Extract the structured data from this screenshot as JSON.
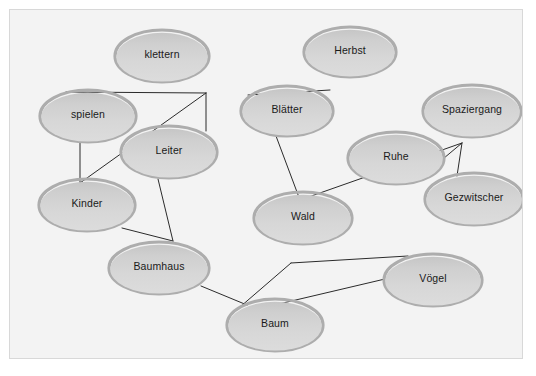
{
  "diagram": {
    "canvas": {
      "background_color": "#f3f3f3",
      "border_color": "#d8d8d8",
      "width": 514,
      "height": 350
    },
    "node_style": {
      "fill_top_color": "#c9c9c9",
      "fill_bottom_color": "#d9d9d9",
      "rim_color": "#adadad",
      "text_color": "#1a1a1a"
    },
    "edge_style": {
      "color": "#2b2b2b",
      "width": 1
    },
    "nodes": [
      {
        "id": "klettern",
        "label": "klettern",
        "cx": 152,
        "cy": 46,
        "rx": 48,
        "ry": 27
      },
      {
        "id": "herbst",
        "label": "Herbst",
        "cx": 340,
        "cy": 42,
        "rx": 47,
        "ry": 26
      },
      {
        "id": "spielen",
        "label": "spielen",
        "cx": 78,
        "cy": 106,
        "rx": 49,
        "ry": 27
      },
      {
        "id": "blaetter",
        "label": "Blätter",
        "cx": 277,
        "cy": 101,
        "rx": 47,
        "ry": 26
      },
      {
        "id": "spaziergang",
        "label": "Spaziergang",
        "cx": 462,
        "cy": 101,
        "rx": 50,
        "ry": 27
      },
      {
        "id": "leiter",
        "label": "Leiter",
        "cx": 159,
        "cy": 142,
        "rx": 49,
        "ry": 27
      },
      {
        "id": "ruhe",
        "label": "Ruhe",
        "cx": 386,
        "cy": 148,
        "rx": 49,
        "ry": 27
      },
      {
        "id": "kinder",
        "label": "Kinder",
        "cx": 77,
        "cy": 195,
        "rx": 49,
        "ry": 27
      },
      {
        "id": "gezwitscher",
        "label": "Gezwitscher",
        "cx": 464,
        "cy": 189,
        "rx": 50,
        "ry": 27
      },
      {
        "id": "wald",
        "label": "Wald",
        "cx": 293,
        "cy": 208,
        "rx": 50,
        "ry": 27
      },
      {
        "id": "baumhaus",
        "label": "Baumhaus",
        "cx": 149,
        "cy": 258,
        "rx": 51,
        "ry": 27
      },
      {
        "id": "voegel",
        "label": "Vögel",
        "cx": 423,
        "cy": 270,
        "rx": 50,
        "ry": 27
      },
      {
        "id": "baum",
        "label": "Baum",
        "cx": 265,
        "cy": 315,
        "rx": 49,
        "ry": 27
      }
    ],
    "edges": [
      {
        "id": "spielen-junction",
        "from": "spielen",
        "to": "junction-left",
        "points": "56,82 196,83"
      },
      {
        "id": "junction-leiter",
        "from": "junction-left",
        "to": "leiter",
        "points": "196,83 196,121"
      },
      {
        "id": "junction-kinder",
        "from": "junction-left",
        "to": "kinder",
        "points": "196,83 70,173"
      },
      {
        "id": "spielen-kinder",
        "from": "spielen",
        "to": "kinder",
        "points": "70,131 70,173"
      },
      {
        "id": "blaetter-herbst",
        "from": "blaetter",
        "to": "herbst",
        "points": "238,85 320,80"
      },
      {
        "id": "blaetter-wald",
        "from": "blaetter",
        "to": "wald",
        "points": "266,126 290,190"
      },
      {
        "id": "wald-junction-right",
        "from": "wald",
        "to": "junction-right",
        "points": "290,190 452,133"
      },
      {
        "id": "junction-gezwitscher",
        "from": "junction-right",
        "to": "gezwitscher",
        "points": "452,133 447,166"
      },
      {
        "id": "gezwitscher-junction",
        "from": "gezwitscher",
        "to": "junction-right",
        "points": "415,164 452,133"
      },
      {
        "id": "leiter-baumhaus",
        "from": "leiter",
        "to": "baumhaus",
        "points": "148,169 163,231"
      },
      {
        "id": "kinder-baumhaus",
        "from": "kinder",
        "to": "baumhaus",
        "points": "112,218 163,231"
      },
      {
        "id": "baumhaus-baum",
        "from": "baumhaus",
        "to": "baum",
        "points": "191,276 237,295"
      },
      {
        "id": "baum-junction-bottom",
        "from": "baum",
        "to": "junction-bottom",
        "points": "230,297 281,253"
      },
      {
        "id": "junction-voegel-top",
        "from": "junction-bottom",
        "to": "voegel",
        "points": "281,253 398,246"
      },
      {
        "id": "baum-voegel",
        "from": "baum",
        "to": "voegel",
        "points": "239,301 375,269"
      }
    ]
  }
}
